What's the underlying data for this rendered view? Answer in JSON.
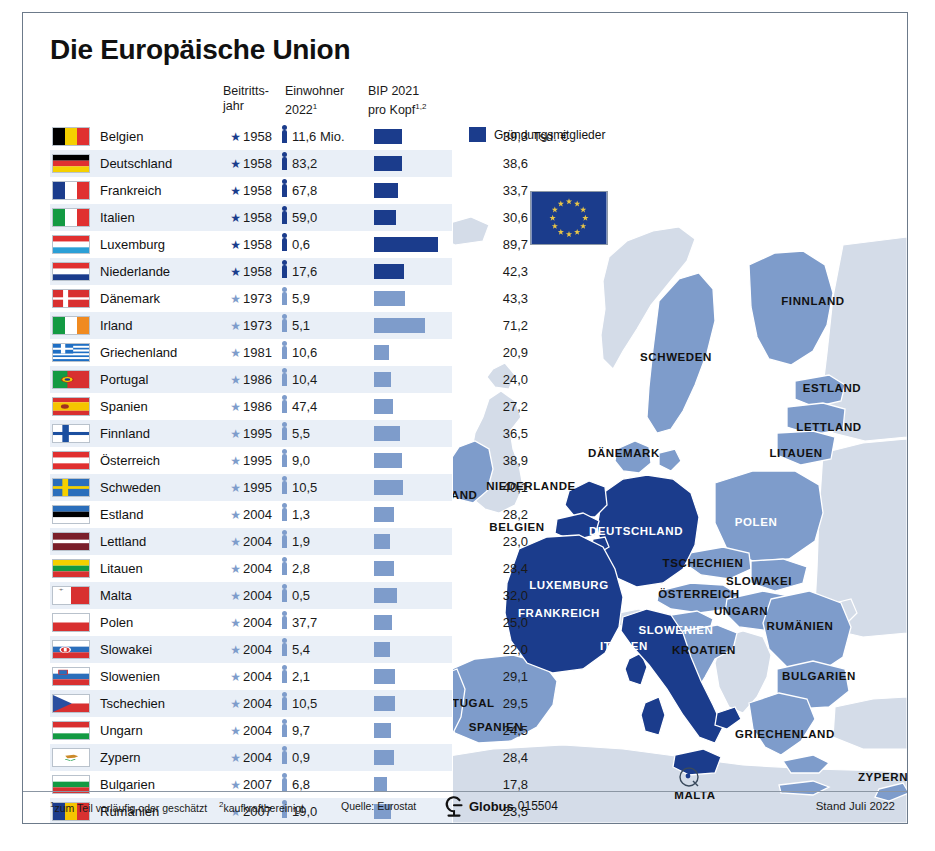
{
  "title": "Die Europäische Union",
  "columns": {
    "flag": "",
    "country": "",
    "year_line1": "Beitritts-",
    "year_line2": "jahr",
    "pop_line1": "Einwohner",
    "pop_line2": "2022",
    "pop_sup": "1",
    "gdp_line1": "BIP 2021",
    "gdp_line2": "pro Kopf",
    "gdp_sup": "1,2"
  },
  "legend": {
    "label": "Gründungsmitglieder",
    "color": "#1b3c8c"
  },
  "colors": {
    "founder": "#1b3c8c",
    "member": "#7e9ccb",
    "map_founder": "#1b3c8c",
    "map_member": "#7e9ccb",
    "map_nonmember": "#d4dce8",
    "row_alt": "#e9eff7",
    "sea": "#ffffff"
  },
  "unit_label": "Tsd. €",
  "chart_data": {
    "type": "table",
    "title": "Die Europäische Union",
    "columns": [
      "Land",
      "Beitrittsjahr",
      "Einwohner 2022 (Mio.)",
      "BIP 2021 pro Kopf (Tsd. €)"
    ],
    "ylabel": "",
    "xlabel": "",
    "rows": [
      {
        "country": "Belgien",
        "year": "1958",
        "pop": "11,6 Mio.",
        "pop_value": 11.6,
        "gdp": "39,3",
        "gdp_value": 39.3,
        "founder": true
      },
      {
        "country": "Deutschland",
        "year": "1958",
        "pop": "83,2",
        "pop_value": 83.2,
        "gdp": "38,6",
        "gdp_value": 38.6,
        "founder": true
      },
      {
        "country": "Frankreich",
        "year": "1958",
        "pop": "67,8",
        "pop_value": 67.8,
        "gdp": "33,7",
        "gdp_value": 33.7,
        "founder": true
      },
      {
        "country": "Italien",
        "year": "1958",
        "pop": "59,0",
        "pop_value": 59.0,
        "gdp": "30,6",
        "gdp_value": 30.6,
        "founder": true
      },
      {
        "country": "Luxemburg",
        "year": "1958",
        "pop": "0,6",
        "pop_value": 0.6,
        "gdp": "89,7",
        "gdp_value": 89.7,
        "founder": true
      },
      {
        "country": "Niederlande",
        "year": "1958",
        "pop": "17,6",
        "pop_value": 17.6,
        "gdp": "42,3",
        "gdp_value": 42.3,
        "founder": true
      },
      {
        "country": "Dänemark",
        "year": "1973",
        "pop": "5,9",
        "pop_value": 5.9,
        "gdp": "43,3",
        "gdp_value": 43.3,
        "founder": false
      },
      {
        "country": "Irland",
        "year": "1973",
        "pop": "5,1",
        "pop_value": 5.1,
        "gdp": "71,2",
        "gdp_value": 71.2,
        "founder": false
      },
      {
        "country": "Griechenland",
        "year": "1981",
        "pop": "10,6",
        "pop_value": 10.6,
        "gdp": "20,9",
        "gdp_value": 20.9,
        "founder": false
      },
      {
        "country": "Portugal",
        "year": "1986",
        "pop": "10,4",
        "pop_value": 10.4,
        "gdp": "24,0",
        "gdp_value": 24.0,
        "founder": false
      },
      {
        "country": "Spanien",
        "year": "1986",
        "pop": "47,4",
        "pop_value": 47.4,
        "gdp": "27,2",
        "gdp_value": 27.2,
        "founder": false
      },
      {
        "country": "Finnland",
        "year": "1995",
        "pop": "5,5",
        "pop_value": 5.5,
        "gdp": "36,5",
        "gdp_value": 36.5,
        "founder": false
      },
      {
        "country": "Österreich",
        "year": "1995",
        "pop": "9,0",
        "pop_value": 9.0,
        "gdp": "38,9",
        "gdp_value": 38.9,
        "founder": false
      },
      {
        "country": "Schweden",
        "year": "1995",
        "pop": "10,5",
        "pop_value": 10.5,
        "gdp": "40,1",
        "gdp_value": 40.1,
        "founder": false
      },
      {
        "country": "Estland",
        "year": "2004",
        "pop": "1,3",
        "pop_value": 1.3,
        "gdp": "28,2",
        "gdp_value": 28.2,
        "founder": false
      },
      {
        "country": "Lettland",
        "year": "2004",
        "pop": "1,9",
        "pop_value": 1.9,
        "gdp": "23,0",
        "gdp_value": 23.0,
        "founder": false
      },
      {
        "country": "Litauen",
        "year": "2004",
        "pop": "2,8",
        "pop_value": 2.8,
        "gdp": "28,4",
        "gdp_value": 28.4,
        "founder": false
      },
      {
        "country": "Malta",
        "year": "2004",
        "pop": "0,5",
        "pop_value": 0.5,
        "gdp": "32,0",
        "gdp_value": 32.0,
        "founder": false
      },
      {
        "country": "Polen",
        "year": "2004",
        "pop": "37,7",
        "pop_value": 37.7,
        "gdp": "25,0",
        "gdp_value": 25.0,
        "founder": false
      },
      {
        "country": "Slowakei",
        "year": "2004",
        "pop": "5,4",
        "pop_value": 5.4,
        "gdp": "22,0",
        "gdp_value": 22.0,
        "founder": false
      },
      {
        "country": "Slowenien",
        "year": "2004",
        "pop": "2,1",
        "pop_value": 2.1,
        "gdp": "29,1",
        "gdp_value": 29.1,
        "founder": false
      },
      {
        "country": "Tschechien",
        "year": "2004",
        "pop": "10,5",
        "pop_value": 10.5,
        "gdp": "29,5",
        "gdp_value": 29.5,
        "founder": false
      },
      {
        "country": "Ungarn",
        "year": "2004",
        "pop": "9,7",
        "pop_value": 9.7,
        "gdp": "24,5",
        "gdp_value": 24.5,
        "founder": false
      },
      {
        "country": "Zypern",
        "year": "2004",
        "pop": "0,9",
        "pop_value": 0.9,
        "gdp": "28,4",
        "gdp_value": 28.4,
        "founder": false
      },
      {
        "country": "Bulgarien",
        "year": "2007",
        "pop": "6,8",
        "pop_value": 6.8,
        "gdp": "17,8",
        "gdp_value": 17.8,
        "founder": false
      },
      {
        "country": "Rumänien",
        "year": "2007",
        "pop": "19,0",
        "pop_value": 19.0,
        "gdp": "23,5",
        "gdp_value": 23.5,
        "founder": false
      },
      {
        "country": "Kroatien",
        "year": "2013",
        "pop": "3,9",
        "pop_value": 3.9,
        "gdp": "22,6",
        "gdp_value": 22.6,
        "founder": false
      }
    ]
  },
  "map": {
    "labels": [
      {
        "name": "IRLAND",
        "x": 431,
        "y": 482,
        "white": false
      },
      {
        "name": "FINNLAND",
        "x": 790,
        "y": 288,
        "white": false
      },
      {
        "name": "SCHWEDEN",
        "x": 653,
        "y": 344,
        "white": false
      },
      {
        "name": "ESTLAND",
        "x": 809,
        "y": 375,
        "white": false
      },
      {
        "name": "LETTLAND",
        "x": 806,
        "y": 414,
        "white": false
      },
      {
        "name": "LITAUEN",
        "x": 773,
        "y": 440,
        "white": false
      },
      {
        "name": "DÄNEMARK",
        "x": 601,
        "y": 440,
        "white": false
      },
      {
        "name": "NIEDERLANDE",
        "x": 508,
        "y": 473,
        "white": false
      },
      {
        "name": "BELGIEN",
        "x": 494,
        "y": 514,
        "white": false
      },
      {
        "name": "DEUTSCHLAND",
        "x": 613,
        "y": 518,
        "white": true
      },
      {
        "name": "POLEN",
        "x": 733,
        "y": 509,
        "white": true
      },
      {
        "name": "TSCHECHIEN",
        "x": 680,
        "y": 550,
        "white": false
      },
      {
        "name": "SLOWAKEI",
        "x": 736,
        "y": 568,
        "white": false
      },
      {
        "name": "LUXEMBURG",
        "x": 546,
        "y": 572,
        "white": true
      },
      {
        "name": "ÖSTERREICH",
        "x": 676,
        "y": 581,
        "white": false
      },
      {
        "name": "UNGARN",
        "x": 718,
        "y": 598,
        "white": false
      },
      {
        "name": "FRANKREICH",
        "x": 536,
        "y": 600,
        "white": true
      },
      {
        "name": "RUMÄNIEN",
        "x": 777,
        "y": 613,
        "white": false
      },
      {
        "name": "SLOWENIEN",
        "x": 653,
        "y": 617,
        "white": true
      },
      {
        "name": "KROATIEN",
        "x": 681,
        "y": 637,
        "white": false
      },
      {
        "name": "ITALIEN",
        "x": 601,
        "y": 633,
        "white": true
      },
      {
        "name": "BULGARIEN",
        "x": 796,
        "y": 663,
        "white": false
      },
      {
        "name": "PORTUGAL",
        "x": 437,
        "y": 690,
        "white": false
      },
      {
        "name": "SPANIEN",
        "x": 473,
        "y": 714,
        "white": false
      },
      {
        "name": "GRIECHENLAND",
        "x": 762,
        "y": 721,
        "white": false
      },
      {
        "name": "MALTA",
        "x": 672,
        "y": 782,
        "white": false
      },
      {
        "name": "ZYPERN",
        "x": 860,
        "y": 764,
        "white": false
      }
    ]
  },
  "footer": {
    "note1": "zum Teil vorläufig oder geschätzt",
    "note1_sup": "1",
    "note2": "kaufkraftbereinigt",
    "note2_sup": "2",
    "source": "Quelle: Eurostat",
    "globus_name": "Globus",
    "globus_number": "015504",
    "stand": "Stand Juli 2022"
  }
}
